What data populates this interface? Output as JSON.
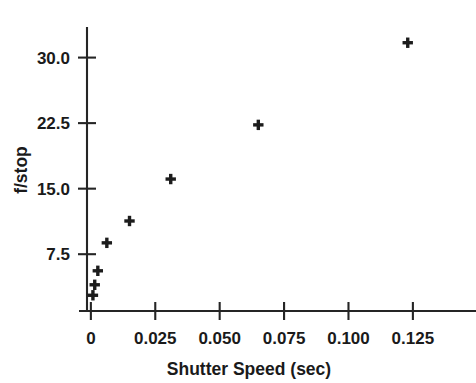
{
  "chart_data": {
    "type": "scatter",
    "title": "",
    "xlabel": "Shutter Speed (sec)",
    "ylabel": "f/stop",
    "xlim": [
      -0.0015,
      0.1495
    ],
    "ylim": [
      1.0,
      33.5
    ],
    "grid": false,
    "legend": null,
    "marker": "plus",
    "marker_color": "#1c1c1c",
    "xticks": [
      0,
      0.025,
      0.05,
      0.075,
      0.1,
      0.125
    ],
    "xticklabels": [
      "0",
      "0.025",
      "0.050",
      "0.075",
      "0.100",
      "0.125"
    ],
    "yticks": [
      7.5,
      15.0,
      22.5,
      30.0
    ],
    "yticklabels": [
      "7.5",
      "15.0",
      "22.5",
      "30.0"
    ],
    "x": [
      0.0008,
      0.0015,
      0.0027,
      0.0062,
      0.015,
      0.031,
      0.065,
      0.123
    ],
    "y": [
      2.8,
      4.0,
      5.6,
      8.8,
      11.3,
      16.1,
      22.3,
      31.7
    ],
    "points": [
      {
        "x": 0.0008,
        "y": 2.8
      },
      {
        "x": 0.0015,
        "y": 4.0
      },
      {
        "x": 0.0027,
        "y": 5.6
      },
      {
        "x": 0.0062,
        "y": 8.8
      },
      {
        "x": 0.015,
        "y": 11.3
      },
      {
        "x": 0.031,
        "y": 16.1
      },
      {
        "x": 0.065,
        "y": 22.3
      },
      {
        "x": 0.123,
        "y": 31.7
      }
    ]
  }
}
